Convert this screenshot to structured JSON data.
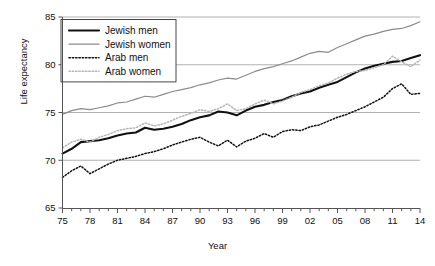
{
  "chart_data": {
    "type": "line",
    "title": "",
    "xlabel": "Year",
    "ylabel": "Life expectancy",
    "xlim": [
      1975,
      2014
    ],
    "ylim": [
      65,
      85
    ],
    "yticks": [
      65,
      70,
      75,
      80,
      85
    ],
    "ytick_labels": [
      "65",
      "70",
      "75",
      "80",
      "85"
    ],
    "xticks": [
      1975,
      1978,
      1981,
      1984,
      1987,
      1990,
      1993,
      1996,
      1999,
      2002,
      2005,
      2008,
      2011,
      2014
    ],
    "xtick_labels": [
      "75",
      "78",
      "81",
      "84",
      "87",
      "90",
      "93",
      "96",
      "99",
      "02",
      "05",
      "08",
      "11",
      "14"
    ],
    "grid": true,
    "grid_axis": "y",
    "legend_position": "top-left",
    "x": [
      1975,
      1976,
      1977,
      1978,
      1979,
      1980,
      1981,
      1982,
      1983,
      1984,
      1985,
      1986,
      1987,
      1988,
      1989,
      1990,
      1991,
      1992,
      1993,
      1994,
      1995,
      1996,
      1997,
      1998,
      1999,
      2000,
      2001,
      2002,
      2003,
      2004,
      2005,
      2006,
      2007,
      2008,
      2009,
      2010,
      2011,
      2012,
      2013,
      2014
    ],
    "series": [
      {
        "name": "Jewish men",
        "color": "#111111",
        "style": "solid",
        "width": 2.1,
        "values": [
          70.7,
          71.2,
          71.9,
          72.0,
          72.1,
          72.3,
          72.6,
          72.8,
          72.9,
          73.4,
          73.2,
          73.3,
          73.5,
          73.8,
          74.2,
          74.5,
          74.7,
          75.1,
          75.0,
          74.7,
          75.2,
          75.6,
          75.8,
          76.1,
          76.3,
          76.7,
          77.0,
          77.2,
          77.6,
          77.9,
          78.2,
          78.7,
          79.2,
          79.6,
          79.9,
          80.1,
          80.3,
          80.4,
          80.7,
          81.0
        ]
      },
      {
        "name": "Jewish women",
        "color": "#8c8c8c",
        "style": "solid",
        "width": 1.2,
        "values": [
          74.8,
          75.2,
          75.4,
          75.3,
          75.5,
          75.7,
          76.0,
          76.1,
          76.4,
          76.7,
          76.6,
          76.9,
          77.2,
          77.4,
          77.6,
          77.9,
          78.1,
          78.4,
          78.6,
          78.5,
          78.9,
          79.3,
          79.6,
          79.8,
          80.1,
          80.4,
          80.8,
          81.2,
          81.4,
          81.3,
          81.8,
          82.2,
          82.6,
          83.0,
          83.2,
          83.5,
          83.7,
          83.8,
          84.1,
          84.5
        ]
      },
      {
        "name": "Arab men",
        "color": "#111111",
        "style": "dotted",
        "width": 1.5,
        "values": [
          68.2,
          68.9,
          69.4,
          68.6,
          69.1,
          69.6,
          70.0,
          70.2,
          70.4,
          70.7,
          70.9,
          71.2,
          71.6,
          71.9,
          72.2,
          72.4,
          71.9,
          71.5,
          72.1,
          71.4,
          72.0,
          72.3,
          72.8,
          72.4,
          73.0,
          73.2,
          73.1,
          73.5,
          73.7,
          74.1,
          74.5,
          74.8,
          75.2,
          75.6,
          76.1,
          76.6,
          77.5,
          78.0,
          76.9,
          77.0
        ]
      },
      {
        "name": "Arab women",
        "color": "#b5b5b5",
        "style": "dotted",
        "width": 1.5,
        "values": [
          71.3,
          71.9,
          72.2,
          71.9,
          72.4,
          72.7,
          73.1,
          73.3,
          73.4,
          73.9,
          73.6,
          73.8,
          74.2,
          74.6,
          74.9,
          75.3,
          75.1,
          75.4,
          75.9,
          75.2,
          75.4,
          75.9,
          76.3,
          75.9,
          76.2,
          76.6,
          77.1,
          77.4,
          77.8,
          78.1,
          78.6,
          79.0,
          79.3,
          79.4,
          79.7,
          80.0,
          80.9,
          80.3,
          79.8,
          80.5
        ]
      }
    ],
    "legend": [
      {
        "label": "Jewish men",
        "color": "#111111",
        "style": "solid",
        "width": 2.1
      },
      {
        "label": "Jewish women",
        "color": "#8c8c8c",
        "style": "solid",
        "width": 1.2
      },
      {
        "label": "Arab men",
        "color": "#111111",
        "style": "dotted",
        "width": 1.5
      },
      {
        "label": "Arab women",
        "color": "#b5b5b5",
        "style": "dotted",
        "width": 1.5
      }
    ]
  }
}
